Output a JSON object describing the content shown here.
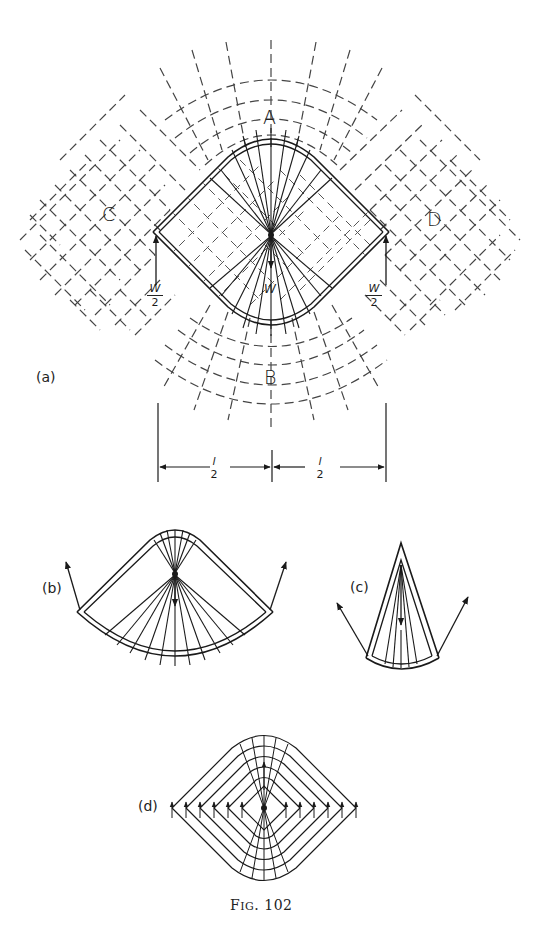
{
  "figure": {
    "caption_prefix": "F",
    "caption_smallcaps": "IG",
    "caption_number": ". 102"
  },
  "panel_a": {
    "label": "(a)",
    "regions": {
      "top": "A",
      "bottom": "B",
      "left": "C",
      "right": "D"
    },
    "loads": {
      "left_num": "W",
      "left_den": "2",
      "center": "W",
      "right_num": "W",
      "right_den": "2"
    },
    "dimensions": {
      "left_num": "l",
      "left_den": "2",
      "right_num": "l",
      "right_den": "2"
    }
  },
  "panel_b": {
    "label": "(b)"
  },
  "panel_c": {
    "label": "(c)"
  },
  "panel_d": {
    "label": "(d)"
  },
  "colors": {
    "ink": "#1a1a1a",
    "paper": "#ffffff",
    "dashed": "#444444"
  }
}
